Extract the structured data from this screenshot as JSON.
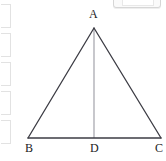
{
  "canvas": {
    "width": 166,
    "height": 161,
    "background": "#ffffff"
  },
  "chrome": {
    "left_brackets_count": 5,
    "bracket_color": "#e2e2e2",
    "top_chip": {
      "name": "partial-toolbar-chip",
      "border_color": "#d6d6d6",
      "fill_color": "#fafafa"
    }
  },
  "figure": {
    "type": "isosceles-triangle-with-altitude",
    "stroke_color": "#3c3c44",
    "altitude_color": "#9a9aa2",
    "stroke_width": 1.2,
    "points": {
      "A": {
        "x": 94,
        "y": 28,
        "label": "A"
      },
      "B": {
        "x": 28,
        "y": 138,
        "label": "B"
      },
      "C": {
        "x": 161,
        "y": 138,
        "label": "C"
      },
      "D": {
        "x": 94,
        "y": 138,
        "label": "D"
      }
    },
    "segments": [
      {
        "name": "side-AB",
        "from": "A",
        "to": "B"
      },
      {
        "name": "side-AC",
        "from": "A",
        "to": "C"
      },
      {
        "name": "base-BC",
        "from": "B",
        "to": "C"
      },
      {
        "name": "altitude-AD",
        "from": "A",
        "to": "D"
      }
    ],
    "labels": [
      {
        "key": "A",
        "text": "A",
        "left": 89,
        "top": 8
      },
      {
        "key": "B",
        "text": "B",
        "left": 25,
        "top": 142
      },
      {
        "key": "D",
        "text": "D",
        "left": 90,
        "top": 142
      },
      {
        "key": "C",
        "text": "C",
        "left": 155,
        "top": 142
      }
    ]
  }
}
